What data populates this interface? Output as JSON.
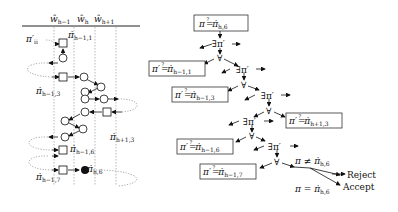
{
  "left_diagram": {
    "column_headers": [
      {
        "base": "ŵ",
        "sub": "h−1"
      },
      {
        "base": "ŵ",
        "sub": "h"
      },
      {
        "base": "ŵ",
        "sub": "h+1"
      }
    ],
    "labels": {
      "pi_prime_ii": {
        "base": "π′",
        "sub": "ii"
      },
      "pi_h_1_1": {
        "base": "π̇",
        "sub": "h−1,1"
      },
      "pi_h_1_3": {
        "base": "π̇",
        "sub": "h−1,3"
      },
      "pi_hp1_3": {
        "base": "π̇",
        "sub": "h+1,3"
      },
      "pi_h_1_6": {
        "base": "π̇",
        "sub": "h−1,6"
      },
      "pi_h_1_7": {
        "base": "π̇",
        "sub": "h−1,7"
      },
      "pi_h_6": {
        "base": "π̇",
        "sub": "h,6"
      }
    }
  },
  "right_tree": {
    "root": {
      "lhs": "π",
      "rel": "=",
      "q": "?",
      "rhs": "π̇",
      "sub": "h,6"
    },
    "exists_label": "∃π′",
    "forall_label": "∀",
    "boxes": [
      {
        "lhs": "π′",
        "rel": "=",
        "q": "?",
        "rhs": "π̇",
        "sub": "h−1,1"
      },
      {
        "lhs": "π′",
        "rel": "=",
        "q": "?",
        "rhs": "π̇",
        "sub": "h−1,3"
      },
      {
        "lhs": "π′",
        "rel": "=",
        "q": "?",
        "rhs": "π̇",
        "sub": "h+1,3"
      },
      {
        "lhs": "π′",
        "rel": "=",
        "q": "?",
        "rhs": "π̇",
        "sub": "h−1,6"
      },
      {
        "lhs": "π′",
        "rel": "=",
        "q": "?",
        "rhs": "π̇",
        "sub": "h−1,7"
      }
    ],
    "outcomes": [
      {
        "condition": "π ≠ π̇",
        "sub": "h,6",
        "result": "Reject"
      },
      {
        "condition": "π = π̇",
        "sub": "h,6",
        "result": "Accept"
      }
    ]
  }
}
